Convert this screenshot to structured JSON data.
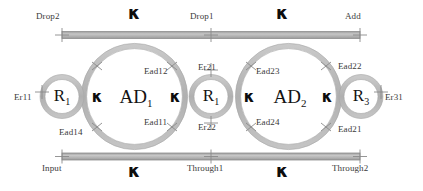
{
  "figure": {
    "colors": {
      "waveguide": "#b3b3b3",
      "waveguide_edge": "#8f8f8f",
      "ring": "#b8b8b8",
      "ring_edge": "#9a9a9a",
      "marker": "#8a8a8a",
      "label_text": "#3a3a3a",
      "symbol_text": "#0d0d0d",
      "background": "#ffffff"
    }
  },
  "bus_top": {
    "port_left": "Drop2",
    "port_mid": "Drop1",
    "port_right": "Add",
    "coupling_left": "κ",
    "coupling_right": "κ"
  },
  "bus_bottom": {
    "port_left": "Input",
    "port_mid": "Through1",
    "port_right": "Through2",
    "coupling_left": "κ",
    "coupling_right": "κ"
  },
  "rings": {
    "r1": {
      "label": "R",
      "sub": "1"
    },
    "ad1": {
      "label": "AD",
      "sub": "1"
    },
    "r2": {
      "label": "R",
      "sub": "1"
    },
    "ad2": {
      "label": "AD",
      "sub": "2"
    },
    "r3": {
      "label": "R",
      "sub": "3"
    }
  },
  "couplings": {
    "r1_ad1": "κ",
    "ad1_r2": "κ",
    "r2_ad2": "κ",
    "ad2_r3": "κ"
  },
  "coupling_labels": {
    "er11": "Er11",
    "ead14": "Ead14",
    "ead12": "Ead12",
    "ead11": "Ead11",
    "er21": "Er21",
    "er22": "Er22",
    "ead23": "Ead23",
    "ead24": "Ead24",
    "ead22": "Ead22",
    "ead21": "Ead21",
    "er31": "Er31"
  }
}
